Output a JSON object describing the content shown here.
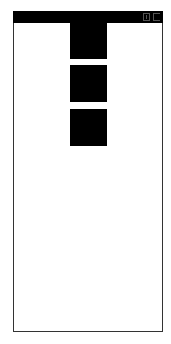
{
  "window": {
    "title": "",
    "controls": [
      {
        "name": "restore-icon"
      },
      {
        "name": "close-icon"
      }
    ]
  },
  "content": {
    "blocks": [
      {
        "top": 12,
        "height": 36
      },
      {
        "top": 54,
        "height": 37
      },
      {
        "top": 98,
        "height": 37
      }
    ]
  },
  "colors": {
    "titlebar": "#000000",
    "background": "#ffffff",
    "block": "#000000",
    "border": "#333333"
  }
}
